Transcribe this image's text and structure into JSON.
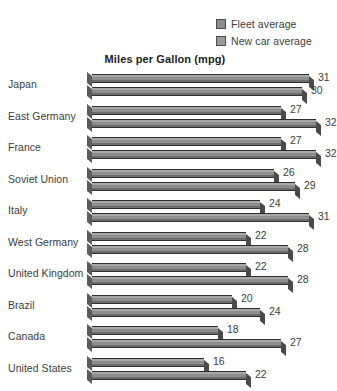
{
  "chart_data": {
    "type": "bar",
    "orientation": "horizontal",
    "title": "Miles per Gallon (mpg)",
    "xlabel": "",
    "ylabel": "",
    "xlim": [
      0,
      34
    ],
    "grid": false,
    "legend_position": "top-right",
    "categories": [
      "Japan",
      "East Germany",
      "France",
      "Soviet Union",
      "Italy",
      "West Germany",
      "United Kingdom",
      "Brazil",
      "Canada",
      "United States"
    ],
    "series": [
      {
        "name": "Fleet average",
        "color": "#8e8e8e",
        "values": [
          31,
          27,
          27,
          26,
          24,
          22,
          22,
          20,
          18,
          16
        ]
      },
      {
        "name": "New car average",
        "color": "#8e8e8e",
        "values": [
          30,
          32,
          32,
          29,
          31,
          28,
          28,
          24,
          27,
          22
        ]
      }
    ]
  },
  "legend": {
    "items": [
      {
        "label": "Fleet average",
        "color": "#8e8e8e"
      },
      {
        "label": "New car average",
        "color": "#9a9a9a"
      }
    ]
  }
}
